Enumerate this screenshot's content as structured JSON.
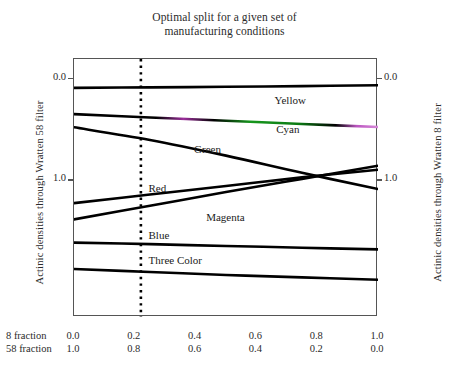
{
  "chart_data": {
    "type": "line",
    "title": "Optimal split for a given set of manufacturing conditions",
    "title_lines": [
      "Optimal split for a given set of",
      "manufacturing conditions"
    ],
    "xlabel": "",
    "ylabel": "Actinic densities through Wratten 58 filter",
    "ylabel_right": "Actinic densities through Wratten 8 filter",
    "xlim": [
      0.0,
      1.0
    ],
    "ylim_top": -0.2,
    "ylim_bottom": 2.35,
    "y_inverted": true,
    "grid": false,
    "legend_position": "inline-labels",
    "y_ticks": [
      0.0,
      1.0
    ],
    "y_tick_labels": [
      "0.0",
      "1.0"
    ],
    "y_ticks_right": [
      0.0,
      1.0
    ],
    "y_tick_labels_right": [
      "0.0",
      "1.0"
    ],
    "x_axis_rows": [
      {
        "label": "8 fraction",
        "values": [
          "0.0",
          "0.2",
          "0.4",
          "0.6",
          "0.8",
          "1.0"
        ]
      },
      {
        "label": "58 fraction",
        "values": [
          "1.0",
          "0.8",
          "0.6",
          "0.4",
          "0.2",
          "0.0"
        ]
      }
    ],
    "x_tick_positions": [
      0.0,
      0.2,
      0.4,
      0.6,
      0.8,
      1.0
    ],
    "annotations": [
      {
        "name": "optimal-split-line",
        "type": "vline",
        "x": 0.22,
        "style": "dotted",
        "color": "#000000"
      }
    ],
    "series": [
      {
        "name": "Yellow",
        "color": "#000000",
        "label": "Yellow",
        "x": [
          0.0,
          0.25,
          0.5,
          0.75,
          1.0
        ],
        "values": [
          0.085,
          0.08,
          0.075,
          0.068,
          0.06
        ]
      },
      {
        "name": "Cyan",
        "color": "#000000",
        "label": "Cyan",
        "fringe_colors": [
          "#b040b0",
          "#1a9a1a"
        ],
        "x": [
          0.0,
          0.25,
          0.5,
          0.75,
          1.0
        ],
        "values": [
          0.345,
          0.378,
          0.41,
          0.442,
          0.472
        ]
      },
      {
        "name": "Green",
        "color": "#000000",
        "label": "Green",
        "x": [
          0.0,
          0.25,
          0.5,
          0.75,
          1.0
        ],
        "values": [
          0.475,
          0.6,
          0.755,
          0.925,
          1.085
        ]
      },
      {
        "name": "Red",
        "color": "#000000",
        "label": "Red",
        "x": [
          0.0,
          0.25,
          0.5,
          0.75,
          1.0
        ],
        "values": [
          1.225,
          1.14,
          1.055,
          0.97,
          0.895
        ]
      },
      {
        "name": "Magenta",
        "color": "#000000",
        "label": "Magenta",
        "x": [
          0.0,
          0.25,
          0.5,
          0.75,
          1.0
        ],
        "values": [
          1.385,
          1.25,
          1.115,
          0.985,
          0.855
        ]
      },
      {
        "name": "Blue",
        "color": "#000000",
        "label": "Blue",
        "x": [
          0.0,
          0.25,
          0.5,
          0.75,
          1.0
        ],
        "values": [
          1.615,
          1.63,
          1.648,
          1.665,
          1.682
        ]
      },
      {
        "name": "Three Color",
        "color": "#000000",
        "label": "Three Color",
        "x": [
          0.0,
          0.25,
          0.5,
          0.75,
          1.0
        ],
        "values": [
          1.875,
          1.905,
          1.935,
          1.958,
          1.982
        ]
      }
    ],
    "curve_label_positions": [
      {
        "name": "Yellow",
        "x": 0.66,
        "y": 0.21
      },
      {
        "name": "Cyan",
        "x": 0.665,
        "y": 0.5
      },
      {
        "name": "Green",
        "x": 0.395,
        "y": 0.695
      },
      {
        "name": "Red",
        "x": 0.245,
        "y": 1.085
      },
      {
        "name": "Magenta",
        "x": 0.435,
        "y": 1.375
      },
      {
        "name": "Blue",
        "x": 0.245,
        "y": 1.545
      },
      {
        "name": "Three Color",
        "x": 0.245,
        "y": 1.8
      }
    ]
  }
}
